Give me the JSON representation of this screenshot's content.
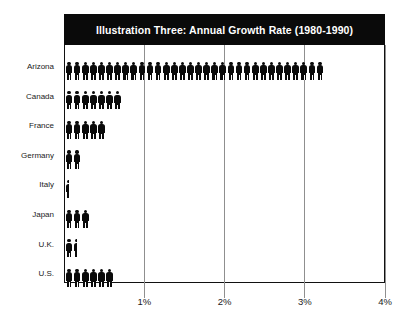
{
  "chart_data": {
    "type": "bar",
    "title": "Illustration Three: Annual Growth Rate (1980-1990)",
    "subtitle": "",
    "xlabel": "",
    "ylabel": "",
    "orientation": "horizontal",
    "pictogram": true,
    "pictogram_icon": "person-icon",
    "pictogram_unit_percent": 0.1,
    "categories": [
      "Arizona",
      "Canada",
      "France",
      "Germany",
      "Italy",
      "Japan",
      "U.K.",
      "U.S."
    ],
    "values": [
      3.2,
      0.75,
      0.45,
      0.22,
      0.05,
      0.3,
      0.18,
      0.65
    ],
    "figure_counts": [
      32,
      7,
      5,
      2,
      0.5,
      3,
      1.5,
      6
    ],
    "xlim": [
      0,
      4
    ],
    "xticks": [
      1,
      2,
      3,
      4
    ],
    "xtick_labels": [
      "1%",
      "2%",
      "3%",
      "4%"
    ],
    "grid": true,
    "grid_axis": "x",
    "legend": false,
    "series": [
      {
        "name": "Annual Growth Rate",
        "values": [
          3.2,
          0.75,
          0.45,
          0.22,
          0.05,
          0.3,
          0.18,
          0.65
        ]
      }
    ],
    "colors": {
      "figure": "#0a0a0a",
      "title_background": "#0a0a0a",
      "title_text": "#ffffff",
      "gridline": "#8f8f8f",
      "frame": "#111111",
      "background": "#ffffff",
      "axis_text": "#1a1a1a"
    }
  },
  "axis": {
    "y_labels": [
      "Arizona",
      "Canada",
      "France",
      "Germany",
      "Italy",
      "Japan",
      "U.K.",
      "U.S."
    ],
    "x_labels": [
      "1%",
      "2%",
      "3%",
      "4%"
    ]
  }
}
